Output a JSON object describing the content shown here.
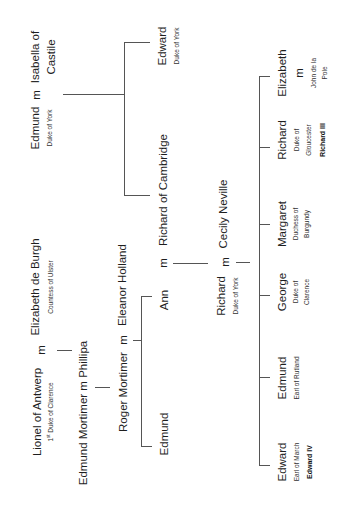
{
  "people": {
    "edmund_york": {
      "name": "Edmund",
      "title": "Duke of York"
    },
    "isabella": {
      "line1": "Isabella of",
      "line2": "Castile"
    },
    "edward_york": {
      "name": "Edward",
      "title": "Duke of York"
    },
    "richard_cambridge": {
      "name": "Richard of Cambridge"
    },
    "elizabeth_burgh": {
      "name": "Elizabeth de Burgh",
      "title": "Countess of Ulster"
    },
    "lionel": {
      "name": "Lionel of Antwerp",
      "title_ord": "1",
      "title_sup": "st",
      "title_rest": " Duke of Clarence"
    },
    "edmund_mortimer_line": "Edmund Mortimer  m  Phillipa",
    "roger_mortimer": {
      "name": "Roger Mortimer"
    },
    "eleanor_holland": {
      "name": "Eleanor Holland"
    },
    "ann": {
      "name": "Ann"
    },
    "edmund_child": {
      "name": "Edmund"
    },
    "richard_york": {
      "name": "Richard",
      "title": "Duke of York"
    },
    "cecily": {
      "name": "Cecily Neville"
    },
    "children": [
      {
        "name": "Edward",
        "title": "Earl of March",
        "regnal": "Edward IV"
      },
      {
        "name": "Edmund",
        "title": "Earl of Rutland"
      },
      {
        "name": "George",
        "title1": "Duke of",
        "title2": "Clarence"
      },
      {
        "name": "Margaret",
        "title1": "Duchess of",
        "title2": "Burgundy"
      },
      {
        "name": "Richard",
        "title1": "Duke of",
        "title2": "Gloucester",
        "regnal": "Richard III"
      },
      {
        "name": "Elizabeth",
        "m": "m",
        "spouse1": "John de la",
        "spouse2": "Pole"
      }
    ]
  },
  "marriage_symbol": "m"
}
